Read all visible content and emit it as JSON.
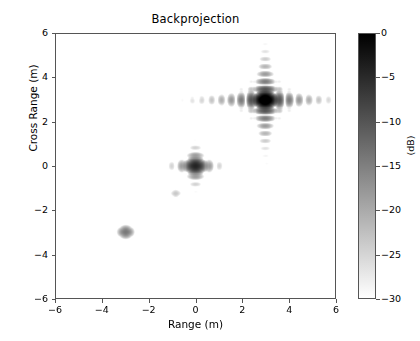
{
  "figure": {
    "background": "#ffffff",
    "axes_edge_color": "#555555",
    "text_color": "#000000"
  },
  "chart_data": {
    "type": "heatmap",
    "title": "Backprojection",
    "xlabel": "Range (m)",
    "ylabel": "Cross Range (m)",
    "xlim": [
      -6,
      6
    ],
    "ylim": [
      -6,
      6
    ],
    "xticks": [
      -6,
      -4,
      -2,
      0,
      2,
      4,
      6
    ],
    "xticklabels": [
      "−6",
      "−4",
      "−2",
      "0",
      "2",
      "4",
      "6"
    ],
    "yticks": [
      -6,
      -4,
      -2,
      0,
      2,
      4,
      6
    ],
    "yticklabels": [
      "−6",
      "−4",
      "−2",
      "0",
      "2",
      "4",
      "6"
    ],
    "grid": false,
    "colormap": "gray_r",
    "colorbar": {
      "label": "(dB)",
      "vmin": -30,
      "vmax": 0,
      "ticks": [
        0,
        -5,
        -10,
        -15,
        -20,
        -25,
        -30
      ],
      "ticklabels": [
        "0",
        "−5",
        "−10",
        "−15",
        "−20",
        "−25",
        "−30"
      ],
      "orientation": "vertical",
      "position": "right",
      "top_color": "#000000",
      "bottom_color": "#ffffff"
    },
    "targets": [
      {
        "name": "target-upper-right",
        "x": 3.0,
        "y": 3.0,
        "peak_db": 0.0,
        "range_resolution": 0.42,
        "crossrange_resolution": 0.34,
        "sidelobe_span_x": 3.4,
        "sidelobe_span_y": 2.3
      },
      {
        "name": "target-center",
        "x": 0.0,
        "y": 0.0,
        "peak_db": -8.0,
        "range_resolution": 0.42,
        "crossrange_resolution": 0.34,
        "sidelobe_span_x": 1.3,
        "sidelobe_span_y": 1.1
      },
      {
        "name": "target-lower-left",
        "x": -3.0,
        "y": -3.0,
        "peak_db": -18.0,
        "range_resolution": 0.42,
        "crossrange_resolution": 0.34,
        "sidelobe_span_x": 0.45,
        "sidelobe_span_y": 0.45
      },
      {
        "name": "artifact-faint",
        "x": -0.85,
        "y": -1.25,
        "peak_db": -27.5,
        "range_resolution": 0.38,
        "crossrange_resolution": 0.32,
        "sidelobe_span_x": 0.25,
        "sidelobe_span_y": 0.25
      }
    ]
  }
}
